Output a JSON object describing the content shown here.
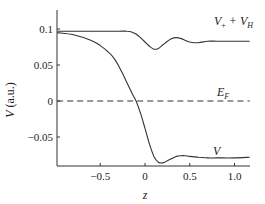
{
  "chart_data": {
    "type": "line",
    "title": "",
    "xlabel": "z",
    "ylabel": "V (a.u.)",
    "xlim": [
      -0.98,
      1.17
    ],
    "ylim": [
      -0.09,
      0.125
    ],
    "grid": false,
    "legend": "inline labels",
    "x_ticks": [
      -0.5,
      0,
      0.5,
      1.0
    ],
    "x_tick_labels": [
      "−0.5",
      "0",
      "0.5",
      "1.0"
    ],
    "y_ticks": [
      0.1,
      0.05,
      0,
      -0.05
    ],
    "y_tick_labels": [
      "0.1",
      "0.05",
      "0",
      "−0.05"
    ],
    "series": [
      {
        "name": "V_+ + V_H",
        "label_main": "V",
        "label_sub1": "+",
        "label_mid": " + V",
        "label_sub2": "H",
        "style": "solid",
        "x": [
          -0.98,
          -0.6,
          -0.3,
          -0.2,
          -0.15,
          -0.1,
          -0.05,
          0.0,
          0.05,
          0.1,
          0.15,
          0.2,
          0.25,
          0.3,
          0.35,
          0.4,
          0.45,
          0.5,
          0.55,
          0.6,
          0.7,
          0.8,
          0.9,
          1.0,
          1.17
        ],
        "values": [
          0.097,
          0.097,
          0.097,
          0.097,
          0.096,
          0.093,
          0.088,
          0.082,
          0.076,
          0.072,
          0.073,
          0.078,
          0.083,
          0.087,
          0.088,
          0.087,
          0.084,
          0.082,
          0.081,
          0.081,
          0.083,
          0.083,
          0.083,
          0.083,
          0.083
        ]
      },
      {
        "name": "V",
        "label_main": "V",
        "style": "solid",
        "x": [
          -0.98,
          -0.8,
          -0.6,
          -0.5,
          -0.4,
          -0.35,
          -0.3,
          -0.25,
          -0.2,
          -0.15,
          -0.1,
          -0.05,
          0.0,
          0.05,
          0.1,
          0.15,
          0.2,
          0.25,
          0.3,
          0.35,
          0.4,
          0.45,
          0.5,
          0.6,
          0.7,
          0.8,
          1.0,
          1.17
        ],
        "values": [
          0.095,
          0.092,
          0.084,
          0.077,
          0.067,
          0.06,
          0.05,
          0.038,
          0.025,
          0.012,
          0.0,
          -0.017,
          -0.038,
          -0.06,
          -0.077,
          -0.085,
          -0.086,
          -0.083,
          -0.08,
          -0.077,
          -0.076,
          -0.076,
          -0.077,
          -0.078,
          -0.079,
          -0.079,
          -0.079,
          -0.078
        ]
      },
      {
        "name": "E_F",
        "label_main": "E",
        "label_sub1": "F",
        "style": "dashed",
        "x": [
          -0.98,
          1.17
        ],
        "values": [
          0,
          0
        ]
      }
    ]
  }
}
